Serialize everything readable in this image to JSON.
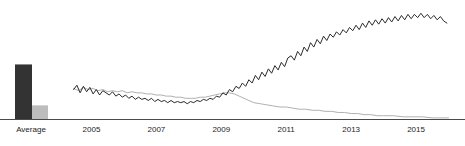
{
  "chart_data": {
    "type": "line",
    "title": "",
    "subtitle": "",
    "xlabel": "",
    "ylabel": "",
    "grid": false,
    "legend": "none",
    "panels": [
      {
        "name": "average-bar-panel",
        "type": "bar",
        "categories": [
          "Average"
        ],
        "category_label": "Average",
        "xlabel": "",
        "ylabel": "",
        "ylim": [
          0,
          100
        ],
        "series": [
          {
            "name": "series-dark",
            "color": "#333333",
            "values": [
              88
            ]
          },
          {
            "name": "series-gray",
            "color": "#bdbdbd",
            "values": [
              22
            ]
          }
        ]
      },
      {
        "name": "timeseries-panel",
        "type": "line",
        "xlabel": "",
        "ylabel": "",
        "xlim": [
          2004.4,
          2016.2
        ],
        "ylim": [
          0,
          100
        ],
        "xticks": [
          2005,
          2007,
          2009,
          2011,
          2013,
          2015
        ],
        "xtick_labels": [
          "2005",
          "2007",
          "2009",
          "2011",
          "2013",
          "2015"
        ],
        "series": [
          {
            "name": "series-dark",
            "color": "#2b2b2b",
            "x": [
              2004.45,
              2004.55,
              2004.65,
              2004.75,
              2004.85,
              2004.95,
              2005.05,
              2005.15,
              2005.25,
              2005.35,
              2005.45,
              2005.55,
              2005.65,
              2005.75,
              2005.85,
              2005.95,
              2006.05,
              2006.15,
              2006.25,
              2006.35,
              2006.45,
              2006.55,
              2006.65,
              2006.75,
              2006.85,
              2006.95,
              2007.05,
              2007.15,
              2007.25,
              2007.35,
              2007.45,
              2007.55,
              2007.65,
              2007.75,
              2007.85,
              2007.95,
              2008.05,
              2008.15,
              2008.25,
              2008.35,
              2008.45,
              2008.55,
              2008.65,
              2008.75,
              2008.85,
              2008.95,
              2009.05,
              2009.15,
              2009.25,
              2009.35,
              2009.45,
              2009.55,
              2009.65,
              2009.75,
              2009.85,
              2009.95,
              2010.05,
              2010.15,
              2010.25,
              2010.35,
              2010.45,
              2010.55,
              2010.65,
              2010.75,
              2010.85,
              2010.95,
              2011.05,
              2011.15,
              2011.25,
              2011.35,
              2011.45,
              2011.55,
              2011.65,
              2011.75,
              2011.85,
              2011.95,
              2012.05,
              2012.15,
              2012.25,
              2012.35,
              2012.45,
              2012.55,
              2012.65,
              2012.75,
              2012.85,
              2012.95,
              2013.05,
              2013.15,
              2013.25,
              2013.35,
              2013.45,
              2013.55,
              2013.65,
              2013.75,
              2013.85,
              2013.95,
              2014.05,
              2014.15,
              2014.25,
              2014.35,
              2014.45,
              2014.55,
              2014.65,
              2014.75,
              2014.85,
              2014.95,
              2015.05,
              2015.15,
              2015.25,
              2015.35,
              2015.45,
              2015.55,
              2015.65,
              2015.75,
              2015.85,
              2015.95
            ],
            "y": [
              27,
              31,
              24,
              30,
              25,
              29,
              23,
              27,
              22,
              26,
              24,
              22,
              25,
              21,
              23,
              20,
              22,
              19,
              21,
              18,
              20,
              18,
              19,
              17,
              19,
              16,
              18,
              16,
              17,
              15,
              17,
              15,
              16,
              15,
              16,
              14,
              16,
              15,
              17,
              16,
              18,
              17,
              19,
              18,
              21,
              20,
              24,
              22,
              27,
              25,
              30,
              28,
              33,
              30,
              36,
              33,
              40,
              36,
              43,
              39,
              46,
              42,
              49,
              45,
              52,
              48,
              56,
              58,
              54,
              62,
              58,
              66,
              62,
              70,
              66,
              73,
              69,
              76,
              72,
              78,
              75,
              80,
              77,
              82,
              79,
              84,
              81,
              86,
              82,
              88,
              84,
              90,
              86,
              91,
              87,
              92,
              88,
              93,
              89,
              94,
              90,
              95,
              91,
              96,
              92,
              96,
              93,
              97,
              93,
              96,
              92,
              95,
              91,
              94,
              90,
              88
            ]
          },
          {
            "name": "series-gray",
            "color": "#b0b0b0",
            "x": [
              2004.45,
              2004.6,
              2004.75,
              2004.9,
              2005.05,
              2005.2,
              2005.35,
              2005.5,
              2005.65,
              2005.8,
              2005.95,
              2006.1,
              2006.25,
              2006.4,
              2006.55,
              2006.7,
              2006.85,
              2007.0,
              2007.15,
              2007.3,
              2007.45,
              2007.6,
              2007.75,
              2007.9,
              2008.05,
              2008.2,
              2008.35,
              2008.5,
              2008.65,
              2008.8,
              2008.95,
              2009.1,
              2009.25,
              2009.4,
              2009.55,
              2009.7,
              2009.85,
              2010.0,
              2010.2,
              2010.4,
              2010.6,
              2010.8,
              2011.0,
              2011.2,
              2011.4,
              2011.6,
              2011.8,
              2012.0,
              2012.2,
              2012.4,
              2012.6,
              2012.8,
              2013.0,
              2013.2,
              2013.4,
              2013.6,
              2013.8,
              2014.0,
              2014.3,
              2014.6,
              2014.9,
              2015.2,
              2015.5,
              2015.8,
              2016.0
            ],
            "y": [
              28,
              26,
              29,
              27,
              28,
              26,
              27,
              25,
              26,
              25,
              26,
              24,
              25,
              24,
              24,
              23,
              23,
              22,
              22,
              21,
              21,
              20,
              20,
              19,
              19,
              19,
              20,
              20,
              21,
              22,
              23,
              24,
              24,
              23,
              21,
              19,
              17,
              15,
              14,
              13,
              12,
              11,
              11,
              10,
              9,
              9,
              8,
              8,
              7,
              7,
              6,
              6,
              5,
              5,
              4,
              4,
              3,
              3,
              3,
              2,
              2,
              2,
              1,
              1,
              1
            ]
          }
        ]
      }
    ]
  },
  "axis": {
    "baseline_color": "#4a4a4a"
  }
}
